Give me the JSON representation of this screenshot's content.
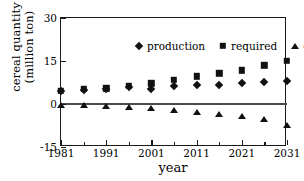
{
  "chart_data": {
    "type": "scatter",
    "title": "",
    "xlabel": "year",
    "ylabel": "cereal quantity (million ton)",
    "ylabel_lines": [
      "cereal quantity",
      "(million ton)"
    ],
    "xlim": [
      1981,
      2031
    ],
    "ylim": [
      -15,
      30
    ],
    "yticks": [
      30,
      15,
      0,
      -15
    ],
    "ytick_labels": [
      "30",
      "15",
      "0",
      "-15"
    ],
    "xticks": [
      1981,
      1991,
      2001,
      2011,
      2021,
      2031
    ],
    "xtick_labels": [
      "1981",
      "1991",
      "2001",
      "2011",
      "2021",
      "2031"
    ],
    "xticks_minor": [
      1986,
      1996,
      2006,
      2016,
      2026
    ],
    "grid": false,
    "zero_line": true,
    "legend_position": "top-center-inside",
    "x": [
      1981,
      1986,
      1991,
      1996,
      2001,
      2006,
      2011,
      2016,
      2021,
      2026,
      2031
    ],
    "series": [
      {
        "name": "production",
        "marker": "diamond",
        "color": "#111111",
        "values": [
          4.5,
          5.0,
          5.4,
          5.8,
          5.4,
          6.2,
          6.5,
          6.8,
          7.4,
          7.7,
          8.0
        ]
      },
      {
        "name": "required",
        "marker": "square",
        "color": "#111111",
        "values": [
          4.5,
          5.3,
          5.5,
          6.3,
          7.2,
          8.4,
          9.7,
          10.7,
          11.8,
          13.5,
          15.0
        ]
      },
      {
        "name": "difference",
        "marker": "triangle",
        "color": "#111111",
        "values": [
          -0.3,
          -0.5,
          -0.6,
          -1.0,
          -1.3,
          -2.0,
          -2.7,
          -3.5,
          -4.2,
          -5.3,
          -7.4
        ]
      }
    ]
  }
}
